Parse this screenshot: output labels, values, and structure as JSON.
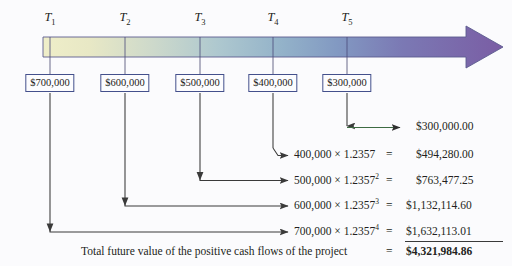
{
  "diagram": {
    "background_color": "#fbfbfd",
    "text_color": "#231f20",
    "box_border_color": "#44508c",
    "arrow_color": "#3a3a3a",
    "green_arrow_color": "#3d6b42",
    "timeline": {
      "gradient_stops": [
        "#eceac4",
        "#d8dfc9",
        "#b9cfd0",
        "#93b3c8",
        "#7f93bd",
        "#7a6aad",
        "#7b5fa6"
      ],
      "arrowhead_color": "#7b5fa6",
      "periods": [
        {
          "label": "T",
          "subscript": "1",
          "cash_flow": "$700,000"
        },
        {
          "label": "T",
          "subscript": "2",
          "cash_flow": "$600,000"
        },
        {
          "label": "T",
          "subscript": "3",
          "cash_flow": "$500,000"
        },
        {
          "label": "T",
          "subscript": "4",
          "cash_flow": "$400,000"
        },
        {
          "label": "T",
          "subscript": "5",
          "cash_flow": "$300,000"
        }
      ]
    },
    "calculations": [
      {
        "expression": "",
        "base": "",
        "rate": "",
        "exponent": "",
        "equals": "",
        "amount": "$300,000.00",
        "has_equals": false
      },
      {
        "expression": "400,000 × 1.2357",
        "base": "400,000",
        "rate": "1.2357",
        "exponent": "",
        "equals": "=",
        "amount": "$494,280.00",
        "has_equals": true
      },
      {
        "expression": "500,000 × 1.2357",
        "base": "500,000",
        "rate": "1.2357",
        "exponent": "2",
        "equals": "=",
        "amount": "$763,477.25",
        "has_equals": true
      },
      {
        "expression": "600,000 × 1.2357",
        "base": "600,000",
        "rate": "1.2357",
        "exponent": "3",
        "equals": "=",
        "amount": "$1,132,114.60",
        "has_equals": true
      },
      {
        "expression": "700,000 × 1.2357",
        "base": "700,000",
        "rate": "1.2357",
        "exponent": "4",
        "equals": "=",
        "amount": "$1,632,113.01",
        "has_equals": true
      }
    ],
    "total": {
      "label": "Total future value of the positive cash flows of the project",
      "equals": "=",
      "amount": "$4,321,984.86"
    },
    "multiplier": "1.2357",
    "times_symbol": "×"
  }
}
